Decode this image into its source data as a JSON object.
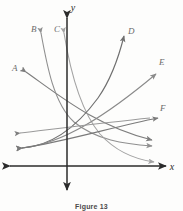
{
  "figure": {
    "caption": "Figure 13",
    "axes": {
      "x_label": "x",
      "y_label": "y",
      "x_axis_color": "#2b2b2b",
      "y_axis_color": "#2b2b2b",
      "origin": [
        67,
        166
      ],
      "x_range_px": [
        8,
        168
      ],
      "y_range_px": [
        16,
        192
      ],
      "grid": false,
      "tick_labels": []
    },
    "curves": [
      {
        "id": "A",
        "label": "A",
        "label_pos": [
          12,
          68
        ],
        "type": "decreasing-concave-up",
        "color": "#7d7d7d",
        "arrow_start": "up-left",
        "arrow_end": "down-right",
        "description": "decaying curve from upper-left to lower-right"
      },
      {
        "id": "B",
        "label": "B",
        "label_pos": [
          33,
          29
        ],
        "type": "decreasing-steep",
        "color": "#8f8f8f",
        "arrow_start": "up",
        "arrow_end": "right",
        "description": "steep decay through second quadrant flattening right"
      },
      {
        "id": "C",
        "label": "C",
        "label_pos": [
          56,
          29
        ],
        "type": "decreasing-steep",
        "color": "#a3a3a3",
        "arrow_start": "up",
        "arrow_end": "right",
        "description": "steep decay flattening toward x-axis"
      },
      {
        "id": "D",
        "label": "D",
        "label_pos": [
          128,
          31
        ],
        "type": "increasing-concave-up",
        "color": "#6f6f6f",
        "arrow_start": "down-left",
        "arrow_end": "up-right",
        "description": "exponential growth to upper right"
      },
      {
        "id": "E",
        "label": "E",
        "label_pos": [
          160,
          62
        ],
        "type": "increasing-concave-up",
        "color": "#8a8a8a",
        "arrow_start": "down-left",
        "arrow_end": "up-right",
        "description": "gentle growth to upper right"
      },
      {
        "id": "F",
        "label": "F",
        "label_pos": [
          161,
          108
        ],
        "type": "increasing-shallow",
        "color": "#7a7a7a",
        "arrow_start": "left",
        "arrow_end": "right",
        "description": "shallow increasing line to right"
      }
    ],
    "colors": {
      "background": "#fdfdfc",
      "axis": "#2b2b2b",
      "curve_default": "#7d7d7d",
      "caption_text": "#4a4a4a"
    }
  }
}
